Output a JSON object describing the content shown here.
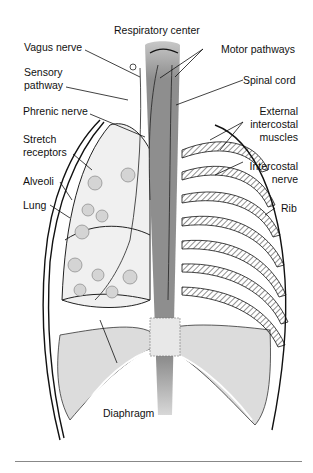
{
  "diagram": {
    "title": "Respiratory center",
    "labels_left": [
      {
        "id": "vagus",
        "text": "Vagus nerve"
      },
      {
        "id": "sensory1",
        "text": "Sensory"
      },
      {
        "id": "sensory2",
        "text": "pathway"
      },
      {
        "id": "phrenic",
        "text": "Phrenic nerve"
      },
      {
        "id": "stretch1",
        "text": "Stretch"
      },
      {
        "id": "stretch2",
        "text": "receptors"
      },
      {
        "id": "alveoli",
        "text": "Alveoli"
      },
      {
        "id": "lung",
        "text": "Lung"
      }
    ],
    "labels_right": [
      {
        "id": "motor",
        "text": "Motor pathways"
      },
      {
        "id": "spinal",
        "text": "Spinal cord"
      },
      {
        "id": "ext1",
        "text": "External"
      },
      {
        "id": "ext2",
        "text": "intercostal"
      },
      {
        "id": "ext3",
        "text": "muscles"
      },
      {
        "id": "icn1",
        "text": "Intercostal"
      },
      {
        "id": "icn2",
        "text": "nerve"
      },
      {
        "id": "rib",
        "text": "Rib"
      }
    ],
    "label_bottom": {
      "text": "Diaphragm"
    },
    "colors": {
      "spinal_cord": "#8e8e8e",
      "lung_fill": "#efefef",
      "diaphragm_fill": "#dcdcdc",
      "line": "#111111"
    }
  }
}
